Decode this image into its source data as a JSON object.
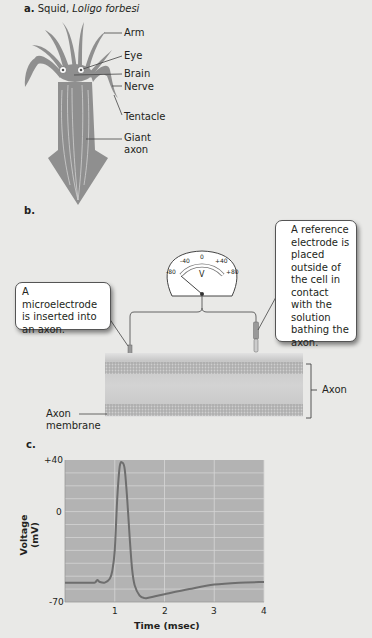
{
  "panel_a": {
    "letter": "a.",
    "title_plain": "Squid, ",
    "title_italic": "Loligo forbesi",
    "labels": [
      "Arm",
      "Eye",
      "Brain",
      "Nerve",
      "Tentacle",
      "Giant",
      "axon"
    ]
  },
  "panel_b": {
    "letter": "b.",
    "meter": {
      "scale_labels": [
        "-80",
        "-40",
        "0",
        "+40",
        "+80"
      ],
      "unit": "V"
    },
    "callout_left": "A microelectrode is inserted into an axon.",
    "callout_right": "A reference electrode is placed outside of the cell in contact with the solution bathing the axon.",
    "label_axon": "Axon",
    "label_membrane_line1": "Axon",
    "label_membrane_line2": "membrane"
  },
  "panel_c": {
    "letter": "c."
  },
  "colors": {
    "background": "#e9e9e7",
    "squid": "#8f8f8f",
    "chart_bg": "#b3b3b3",
    "grid": "#d6d6d6",
    "curve": "#6e6e6e"
  },
  "chart_data": {
    "type": "line",
    "title": "",
    "xlabel": "Time (msec)",
    "ylabel": "Voltage (mV)",
    "xlim": [
      0,
      4
    ],
    "ylim": [
      -70,
      40
    ],
    "x_ticks": [
      "1",
      "2",
      "3",
      "4"
    ],
    "y_ticks": [
      "+40",
      "0",
      "-70"
    ],
    "grid": true,
    "series": [
      {
        "name": "Membrane potential",
        "x": [
          0,
          0.5,
          0.6,
          0.65,
          0.7,
          0.8,
          0.9,
          0.95,
          1.0,
          1.05,
          1.1,
          1.15,
          1.2,
          1.25,
          1.3,
          1.35,
          1.4,
          1.5,
          1.6,
          1.7,
          2.0,
          2.5,
          3.0,
          3.5,
          4.0
        ],
        "y": [
          -55,
          -55,
          -55,
          -53,
          -54.5,
          -55,
          -52,
          -46,
          -30,
          10,
          35,
          38,
          33,
          10,
          -20,
          -45,
          -57,
          -65,
          -67,
          -66.5,
          -64,
          -60,
          -56.5,
          -55,
          -54.5
        ]
      }
    ]
  }
}
